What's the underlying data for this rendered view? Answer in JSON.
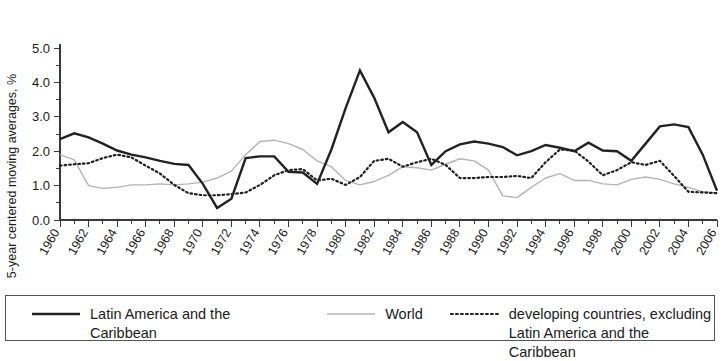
{
  "chart_data": {
    "type": "line",
    "title": "",
    "xlabel": "",
    "ylabel": "5-year centered moving averages, %",
    "xlim": [
      1960,
      2006
    ],
    "ylim": [
      0.0,
      5.0
    ],
    "ytick_labels": [
      "0.0",
      "1.0",
      "2.0",
      "3.0",
      "4.0",
      "5.0"
    ],
    "ytick_values": [
      0.0,
      1.0,
      2.0,
      3.0,
      4.0,
      5.0
    ],
    "y_minor_step": 0.5,
    "x_major_step": 2,
    "x_minor_step": 1,
    "grid": false,
    "legend_position": "below-bordered-box",
    "xtick_labels": [
      "1960",
      "1962",
      "1964",
      "1966",
      "1968",
      "1970",
      "1972",
      "1974",
      "1976",
      "1978",
      "1980",
      "1982",
      "1984",
      "1986",
      "1988",
      "1990",
      "1992",
      "1994",
      "1996",
      "1998",
      "2000",
      "2002",
      "2004",
      "2006"
    ],
    "x": [
      1960,
      1961,
      1962,
      1963,
      1964,
      1965,
      1966,
      1967,
      1968,
      1969,
      1970,
      1971,
      1972,
      1973,
      1974,
      1975,
      1976,
      1977,
      1978,
      1979,
      1980,
      1981,
      1982,
      1983,
      1984,
      1985,
      1986,
      1987,
      1988,
      1989,
      1990,
      1991,
      1992,
      1993,
      1994,
      1995,
      1996,
      1997,
      1998,
      1999,
      2000,
      2001,
      2002,
      2003,
      2004,
      2005,
      2006
    ],
    "series": [
      {
        "name": "Latin America and the Caribbean",
        "color": "#222222",
        "style": "solid-thick",
        "values": [
          2.35,
          2.52,
          2.4,
          2.22,
          2.02,
          1.9,
          1.82,
          1.72,
          1.63,
          1.6,
          1.05,
          0.35,
          0.62,
          1.8,
          1.85,
          1.85,
          1.4,
          1.38,
          1.05,
          2.05,
          3.25,
          4.35,
          3.55,
          2.55,
          2.85,
          2.55,
          1.6,
          2.0,
          2.2,
          2.28,
          2.22,
          2.12,
          1.88,
          2.0,
          2.18,
          2.1,
          2.0,
          2.25,
          2.02,
          2.0,
          1.72,
          2.22,
          2.72,
          2.78,
          2.7,
          1.9,
          0.85
        ]
      },
      {
        "name": "World",
        "color": "#b4b4b4",
        "style": "solid-thin",
        "values": [
          1.9,
          1.75,
          1.0,
          0.92,
          0.95,
          1.02,
          1.02,
          1.05,
          1.02,
          1.05,
          1.1,
          1.22,
          1.42,
          1.9,
          2.28,
          2.32,
          2.22,
          2.05,
          1.72,
          1.55,
          1.15,
          1.02,
          1.12,
          1.3,
          1.55,
          1.52,
          1.45,
          1.62,
          1.78,
          1.72,
          1.45,
          0.7,
          0.65,
          0.95,
          1.22,
          1.35,
          1.15,
          1.15,
          1.05,
          1.02,
          1.18,
          1.25,
          1.18,
          1.05,
          0.95,
          0.82,
          0.78
        ]
      },
      {
        "name": "developing countries, excluding Latin America and the Caribbean",
        "color": "#1f1f1f",
        "style": "dotted",
        "values": [
          1.58,
          1.62,
          1.65,
          1.8,
          1.9,
          1.82,
          1.58,
          1.35,
          1.02,
          0.78,
          0.72,
          0.72,
          0.75,
          0.8,
          1.02,
          1.3,
          1.45,
          1.48,
          1.15,
          1.2,
          1.02,
          1.25,
          1.72,
          1.78,
          1.55,
          1.68,
          1.78,
          1.6,
          1.22,
          1.22,
          1.25,
          1.25,
          1.28,
          1.22,
          1.68,
          2.05,
          2.02,
          1.7,
          1.3,
          1.45,
          1.68,
          1.6,
          1.72,
          1.28,
          0.82,
          0.8,
          0.78
        ]
      }
    ]
  },
  "legend": {
    "entries": [
      {
        "label": "Latin America and the Caribbean",
        "swatch": "solid-thick"
      },
      {
        "label": "World",
        "swatch": "solid-thin"
      },
      {
        "label": "developing countries, excluding\nLatin America and the Caribbean",
        "swatch": "dotted"
      }
    ]
  }
}
